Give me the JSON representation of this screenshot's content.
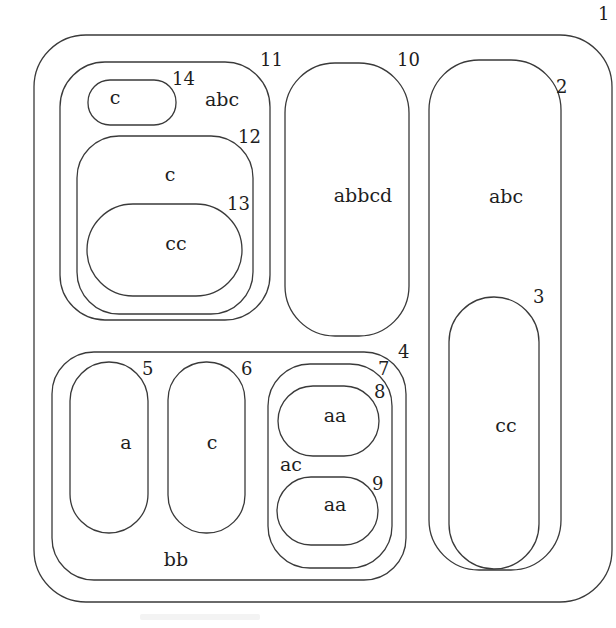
{
  "diagram": {
    "type": "nested-regions",
    "stroke_color": "#3a3a3a",
    "regions": [
      {
        "id": "1",
        "label": "",
        "x": 34,
        "y": 35,
        "w": 578,
        "h": 567,
        "rx": 52,
        "num_x": 598,
        "num_y": 20,
        "label_x": 0,
        "label_y": 0
      },
      {
        "id": "2",
        "label": "abc",
        "x": 429,
        "y": 60,
        "w": 132,
        "h": 510,
        "rx": 50,
        "num_x": 556,
        "num_y": 93,
        "label_x": 506,
        "label_y": 203
      },
      {
        "id": "3",
        "label": "cc",
        "x": 449,
        "y": 297,
        "w": 90,
        "h": 272,
        "rx": 45,
        "num_x": 533,
        "num_y": 303,
        "label_x": 506,
        "label_y": 432
      },
      {
        "id": "4",
        "label": "bb",
        "x": 52,
        "y": 352,
        "w": 354,
        "h": 228,
        "rx": 42,
        "num_x": 398,
        "num_y": 358,
        "label_x": 176,
        "label_y": 566
      },
      {
        "id": "5",
        "label": "a",
        "x": 70,
        "y": 362,
        "w": 78,
        "h": 171,
        "rx": 39,
        "num_x": 142,
        "num_y": 375,
        "label_x": 126,
        "label_y": 449
      },
      {
        "id": "6",
        "label": "c",
        "x": 168,
        "y": 362,
        "w": 77,
        "h": 171,
        "rx": 38,
        "num_x": 241,
        "num_y": 375,
        "label_x": 212,
        "label_y": 449
      },
      {
        "id": "7",
        "label": "ac",
        "x": 268,
        "y": 364,
        "w": 124,
        "h": 204,
        "rx": 42,
        "num_x": 378,
        "num_y": 375,
        "label_x": 291,
        "label_y": 471
      },
      {
        "id": "8",
        "label": "aa",
        "x": 278,
        "y": 386,
        "w": 101,
        "h": 70,
        "rx": 35,
        "num_x": 374,
        "num_y": 398,
        "label_x": 335,
        "label_y": 422
      },
      {
        "id": "9",
        "label": "aa",
        "x": 277,
        "y": 477,
        "w": 101,
        "h": 68,
        "rx": 34,
        "num_x": 372,
        "num_y": 490,
        "label_x": 335,
        "label_y": 511
      },
      {
        "id": "10",
        "label": "abbcd",
        "x": 285,
        "y": 63,
        "w": 124,
        "h": 273,
        "rx": 50,
        "num_x": 397,
        "num_y": 66,
        "label_x": 363,
        "label_y": 202
      },
      {
        "id": "11",
        "label": "abc",
        "x": 60,
        "y": 62,
        "w": 210,
        "h": 258,
        "rx": 45,
        "num_x": 260,
        "num_y": 66,
        "label_x": 222,
        "label_y": 106
      },
      {
        "id": "12",
        "label": "c",
        "x": 77,
        "y": 136,
        "w": 176,
        "h": 178,
        "rx": 42,
        "num_x": 238,
        "num_y": 143,
        "label_x": 170,
        "label_y": 181
      },
      {
        "id": "13",
        "label": "cc",
        "x": 87,
        "y": 204,
        "w": 155,
        "h": 92,
        "rx": 46,
        "num_x": 227,
        "num_y": 210,
        "label_x": 176,
        "label_y": 250
      },
      {
        "id": "14",
        "label": "c",
        "x": 88,
        "y": 80,
        "w": 88,
        "h": 45,
        "rx": 22,
        "num_x": 172,
        "num_y": 85,
        "label_x": 115,
        "label_y": 104
      }
    ]
  }
}
